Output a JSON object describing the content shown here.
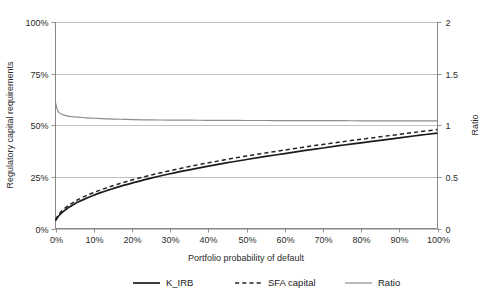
{
  "chart_data": {
    "type": "line",
    "title": "",
    "xlabel": "Portfolio probability of default",
    "ylabel": "Regulatory capital requirements",
    "y2label": "Ratio",
    "xlim": [
      0,
      100
    ],
    "ylim": [
      0,
      100
    ],
    "y2lim": [
      0,
      2
    ],
    "grid": true,
    "legend_position": "bottom",
    "x_ticks": [
      "0%",
      "10%",
      "20%",
      "30%",
      "40%",
      "50%",
      "60%",
      "70%",
      "80%",
      "90%",
      "100%"
    ],
    "x_tick_values": [
      0,
      10,
      20,
      30,
      40,
      50,
      60,
      70,
      80,
      90,
      100
    ],
    "y_ticks": [
      "0%",
      "25%",
      "50%",
      "75%",
      "100%"
    ],
    "y_tick_values": [
      0,
      25,
      50,
      75,
      100
    ],
    "y2_ticks": [
      "0",
      "0.5",
      "1",
      "1.5",
      "2"
    ],
    "y2_tick_values": [
      0,
      0.5,
      1,
      1.5,
      2
    ],
    "x": [
      0,
      0.5,
      1,
      2,
      3,
      4,
      5,
      6,
      8,
      10,
      12,
      14,
      16,
      18,
      20,
      25,
      30,
      35,
      40,
      45,
      50,
      55,
      60,
      65,
      70,
      75,
      80,
      85,
      90,
      95,
      100
    ],
    "series": [
      {
        "name": "K_IRB",
        "axis": "left",
        "style": "solid",
        "color": "#1c1c1c",
        "values": [
          3.8,
          5.2,
          6.4,
          8.2,
          9.6,
          10.8,
          11.9,
          12.9,
          14.6,
          16.1,
          17.5,
          18.7,
          19.9,
          21.0,
          22.0,
          24.4,
          26.5,
          28.4,
          30.2,
          31.9,
          33.4,
          34.9,
          36.3,
          37.7,
          39.0,
          40.3,
          41.5,
          42.7,
          43.9,
          45.1,
          46.2
        ]
      },
      {
        "name": "SFA capital",
        "axis": "left",
        "style": "dashed",
        "color": "#242424",
        "values": [
          4.3,
          5.9,
          7.2,
          9.1,
          10.6,
          11.9,
          13.0,
          14.1,
          15.9,
          17.4,
          18.8,
          20.1,
          21.3,
          22.4,
          23.5,
          25.9,
          28.0,
          30.0,
          31.8,
          33.5,
          35.1,
          36.6,
          38.0,
          39.4,
          40.7,
          42.0,
          43.2,
          44.4,
          45.6,
          46.8,
          47.9
        ]
      },
      {
        "name": "Ratio",
        "axis": "right",
        "style": "solid",
        "color": "#8c8c8c",
        "values": [
          1.22,
          1.15,
          1.12,
          1.1,
          1.09,
          1.085,
          1.08,
          1.078,
          1.072,
          1.068,
          1.064,
          1.061,
          1.059,
          1.057,
          1.055,
          1.052,
          1.05,
          1.049,
          1.048,
          1.047,
          1.046,
          1.046,
          1.045,
          1.045,
          1.044,
          1.044,
          1.043,
          1.043,
          1.042,
          1.042,
          1.042
        ]
      }
    ]
  },
  "legend": {
    "items": [
      {
        "label": "K_IRB",
        "style": "solid",
        "color": "#1c1c1c"
      },
      {
        "label": "SFA capital",
        "style": "dashed",
        "color": "#242424"
      },
      {
        "label": "Ratio",
        "style": "solid",
        "color": "#8c8c8c"
      }
    ]
  }
}
